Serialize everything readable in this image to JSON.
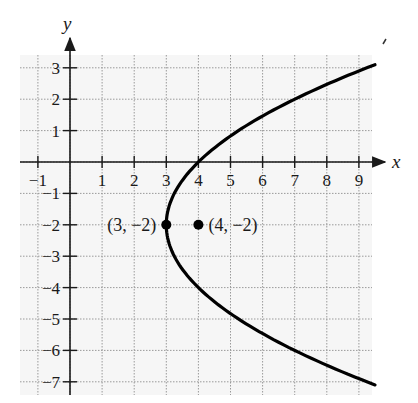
{
  "chart_data": {
    "type": "line",
    "title": "",
    "xlabel": "x",
    "ylabel": "y",
    "xlim": [
      -1.5,
      9.7
    ],
    "ylim": [
      -7.4,
      3.6
    ],
    "x_ticks": [
      -1,
      1,
      2,
      3,
      4,
      5,
      6,
      7,
      8,
      9
    ],
    "y_ticks": [
      3,
      2,
      1,
      -1,
      -2,
      -3,
      -4,
      -5,
      -6,
      -7
    ],
    "x_tick_labels": [
      "−1",
      "1",
      "2",
      "3",
      "4",
      "5",
      "6",
      "7",
      "8",
      "9"
    ],
    "y_tick_labels": [
      "3",
      "2",
      "1",
      "−1",
      "−2",
      "−3",
      "−4",
      "−5",
      "−6",
      "−7"
    ],
    "grid": true,
    "grid_style": "dotted",
    "series": [
      {
        "name": "parabola (y+2)^2 = 4(x-3)",
        "equation": "(y + 2)^2 = 4(x - 3)",
        "points": [
          [
            9.5,
            3.1
          ],
          [
            8,
            2.47
          ],
          [
            7,
            2.0
          ],
          [
            6,
            1.46
          ],
          [
            5,
            0.83
          ],
          [
            4,
            0
          ],
          [
            3.5,
            -0.59
          ],
          [
            3.25,
            -1.0
          ],
          [
            3,
            -2
          ],
          [
            3.25,
            -3.0
          ],
          [
            3.5,
            -3.41
          ],
          [
            4,
            -4
          ],
          [
            5,
            -4.83
          ],
          [
            6,
            -5.46
          ],
          [
            7,
            -6.0
          ],
          [
            8,
            -6.47
          ],
          [
            9.5,
            -7.1
          ]
        ]
      }
    ],
    "annotations": [
      {
        "label": "(3, −2)",
        "x": 3,
        "y": -2,
        "role": "vertex"
      },
      {
        "label": "(4, −2)",
        "x": 4,
        "y": -2,
        "role": "focus"
      }
    ],
    "colors": {
      "curve": "#000000",
      "grid": "#9a9a9a",
      "axis": "#1a1a1a",
      "background": "#f5f5f5"
    }
  }
}
